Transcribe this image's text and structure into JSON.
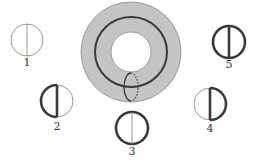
{
  "figure": {
    "colors": {
      "background": "#ffffff",
      "torus_fill": "#c4c4c4",
      "torus_edge": "#8a8a8a",
      "stroke_thick": "#3a3a3a",
      "stroke_thin": "#8a8a8a"
    },
    "torus": {
      "cx": 131,
      "cy": 52,
      "outer_r": 50,
      "inner_r": 20,
      "longitude_rx": 36,
      "longitude_ry": 35,
      "meridian": {
        "cx": 131,
        "cy": 87,
        "rx": 7,
        "ry": 14,
        "front": "solid",
        "back": "dotted"
      }
    },
    "symbols": [
      {
        "id": "1",
        "label": "1",
        "cx": 27,
        "cy": 40,
        "r": 16,
        "left_arc": "thin",
        "right_arc": "thin",
        "chord": "thin",
        "label_y": 66
      },
      {
        "id": "2",
        "label": "2",
        "cx": 57,
        "cy": 101,
        "r": 16,
        "left_arc": "thick",
        "right_arc": "thin",
        "chord": "thick",
        "label_y": 130
      },
      {
        "id": "3",
        "label": "3",
        "cx": 132,
        "cy": 128,
        "r": 16,
        "left_arc": "thick",
        "right_arc": "thick",
        "chord": "thin",
        "label_y": 155
      },
      {
        "id": "4",
        "label": "4",
        "cx": 210,
        "cy": 104,
        "r": 16,
        "left_arc": "thin",
        "right_arc": "thick",
        "chord": "thick",
        "label_y": 132
      },
      {
        "id": "5",
        "label": "5",
        "cx": 229,
        "cy": 42,
        "r": 16,
        "left_arc": "thick",
        "right_arc": "thick",
        "chord": "thick",
        "label_y": 68
      }
    ]
  }
}
